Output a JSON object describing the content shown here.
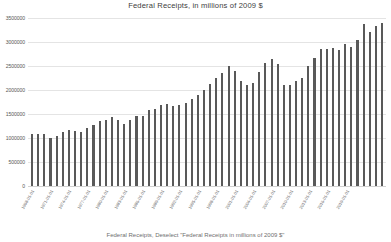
{
  "chart_data": {
    "type": "bar",
    "title": "Federal Receipts, in millions of 2009 $",
    "xlabel": "",
    "ylabel": "",
    "ylim": [
      0,
      3500000
    ],
    "yticks": [
      3500000,
      3000000,
      2500000,
      2000000,
      1500000,
      1000000,
      500000,
      0
    ],
    "ytick_labels": [
      "3500000",
      "3000000",
      "2500000",
      "2000000",
      "1500000",
      "1000000",
      "500000",
      "0"
    ],
    "grid": true,
    "legend": "none",
    "bar_color": "#595959",
    "categories": [
      "1968-01-01",
      "1969-01-01",
      "1970-01-01",
      "1971-01-01",
      "1972-01-01",
      "1973-01-01",
      "1974-01-01",
      "1975-01-01",
      "1976-01-01",
      "1977-01-01",
      "1978-01-01",
      "1979-01-01",
      "1980-01-01",
      "1981-01-01",
      "1982-01-01",
      "1983-01-01",
      "1984-01-01",
      "1985-01-01",
      "1986-01-01",
      "1987-01-01",
      "1988-01-01",
      "1989-01-01",
      "1990-01-01",
      "1991-01-01",
      "1992-01-01",
      "1993-01-01",
      "1994-01-01",
      "1995-01-01",
      "1996-01-01",
      "1997-01-01",
      "1998-01-01",
      "1999-01-01",
      "2000-01-01",
      "2001-01-01",
      "2002-01-01",
      "2003-01-01",
      "2004-01-01",
      "2005-01-01",
      "2006-01-01",
      "2007-01-01",
      "2008-01-01",
      "2009-01-01",
      "2010-01-01",
      "2011-01-01",
      "2012-01-01",
      "2013-01-01",
      "2014-01-01",
      "2015-01-01",
      "2016-01-01",
      "2017-01-01",
      "2018-01-01",
      "2019-01-01",
      "2020-01-01",
      "2021-01-01",
      "2022-01-01",
      "2023-01-01",
      "2024-01-01",
      "2025-01-01"
    ],
    "xtick_labels": [
      "1968-01-01",
      "1971-01-01",
      "1974-01-01",
      "1977-01-01",
      "1980-01-01",
      "1983-01-01",
      "1986-01-01",
      "1989-01-01",
      "1992-01-01",
      "1995-01-01",
      "1998-01-01",
      "2001-01-01",
      "2004-01-01",
      "2007-01-01",
      "2010-01-01",
      "2013-01-01",
      "2016-01-01",
      "2019-01-01"
    ],
    "values": [
      1075000,
      1080000,
      1075000,
      1010000,
      1045000,
      1120000,
      1175000,
      1140000,
      1130000,
      1215000,
      1280000,
      1345000,
      1375000,
      1430000,
      1375000,
      1300000,
      1375000,
      1450000,
      1465000,
      1575000,
      1605000,
      1690000,
      1700000,
      1660000,
      1690000,
      1720000,
      1810000,
      1900000,
      2000000,
      2130000,
      2255000,
      2345000,
      2500000,
      2395000,
      2195000,
      2105000,
      2150000,
      2375000,
      2560000,
      2650000,
      2540000,
      2105000,
      2105000,
      2195000,
      2260000,
      2500000,
      2660000,
      2860000,
      2850000,
      2870000,
      2830000,
      2960000,
      2890000,
      3050000,
      3380000,
      3210000,
      3330000,
      3400000
    ]
  },
  "caption": {
    "text": "Federal Receipts, Deselect \"Federal Receipts in millions of 2009 $\""
  }
}
